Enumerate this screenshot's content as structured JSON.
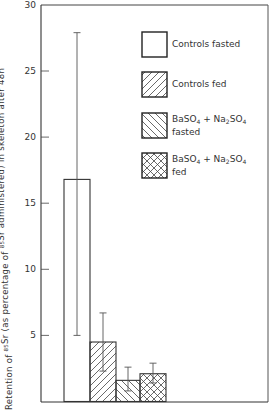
{
  "chart_data": {
    "type": "bar",
    "title": "",
    "xlabel": "",
    "ylabel": "Retention of 85Sr (as percentage of 85Sr administered) in skeleton after 48h",
    "ylabel_parts": {
      "pre": "Retention of ",
      "sup1": "85",
      "mid": "Sr (as percentage of ",
      "sup2": "85",
      "post": "Sr administered) in skeleton after 48h"
    },
    "ylim": [
      0,
      30
    ],
    "yticks": [
      5,
      10,
      15,
      20,
      25,
      30
    ],
    "grid": false,
    "legend_position": "upper right (inside)",
    "categories": [
      "Controls fasted",
      "Controls fed",
      "BaSO4 + Na2SO4 fasted",
      "BaSO4 + Na2SO4 fed"
    ],
    "values": [
      16.8,
      4.5,
      1.6,
      2.1
    ],
    "error_bars": [
      {
        "low": 5.0,
        "high": 27.9
      },
      {
        "low": 2.3,
        "high": 6.7
      },
      {
        "low": 0.8,
        "high": 2.6
      },
      {
        "low": 1.4,
        "high": 2.9
      }
    ],
    "patterns": [
      "none",
      "diagonal-right",
      "diagonal-left",
      "crosshatch"
    ]
  },
  "legend": [
    {
      "line1": "Controls fasted",
      "line2": "",
      "pattern": "none"
    },
    {
      "line1": "Controls fed",
      "line2": "",
      "pattern": "diagonal-right"
    },
    {
      "line1": "BaSO",
      "sub1": "4",
      "plus": " + Na",
      "sub2": "2",
      "rest": "SO",
      "sub3": "4",
      "line2": "fasted",
      "pattern": "diagonal-left"
    },
    {
      "line1": "BaSO",
      "sub1": "4",
      "plus": " + Na",
      "sub2": "2",
      "rest": "SO",
      "sub3": "4",
      "line2": "fed",
      "pattern": "crosshatch"
    }
  ],
  "colors": {
    "ink": "#333333",
    "background": "#ffffff"
  }
}
